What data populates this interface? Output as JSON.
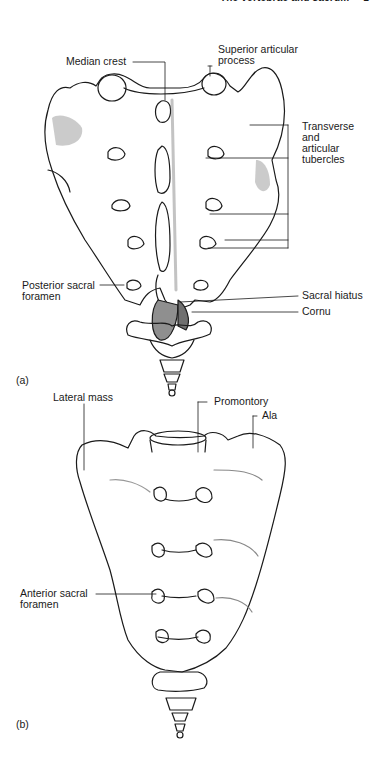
{
  "header": {
    "running_title": "The vertebrae and sacrum",
    "page_number": "1"
  },
  "figure_a": {
    "tag": "(a)",
    "labels": {
      "median_crest": "Median crest",
      "superior_articular_1": "Superior articular",
      "superior_articular_2": "process",
      "transverse_1": "Transverse",
      "transverse_2": "and",
      "transverse_3": "articular",
      "transverse_4": "tubercles",
      "posterior_foramen_1": "Posterior sacral",
      "posterior_foramen_2": "foramen",
      "sacral_hiatus": "Sacral hiatus",
      "cornu": "Cornu"
    }
  },
  "figure_b": {
    "tag": "(b)",
    "labels": {
      "lateral_mass": "Lateral mass",
      "promontory": "Promontory",
      "ala": "Ala",
      "anterior_foramen_1": "Anterior sacral",
      "anterior_foramen_2": "foramen"
    }
  },
  "colors": {
    "ink": "#1a1a1a",
    "shade": "#9a9a9a",
    "paper": "#ffffff"
  }
}
